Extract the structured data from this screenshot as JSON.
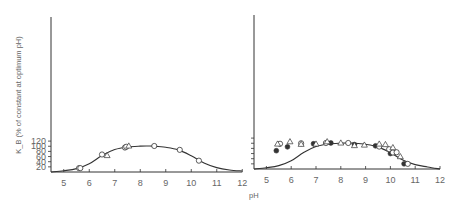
{
  "figure": {
    "ylabel": "K_B (% of constant at optimum pH)",
    "xlabel": "pH",
    "colors": {
      "line": "#333333",
      "marker": "#333333",
      "text": "#666666"
    }
  },
  "chart_data": [
    {
      "type": "scatter",
      "panel": "left",
      "title": "",
      "xlabel": "",
      "ylabel": "K_B (% of constant at optimum pH)",
      "xlim": [
        4.5,
        12
      ],
      "ylim": [
        0,
        120
      ],
      "xticks": [
        5,
        6,
        7,
        8,
        9,
        10,
        11,
        12
      ],
      "yticks": [
        20,
        40,
        60,
        80,
        100,
        120
      ],
      "grid": false,
      "curve": {
        "name": "fitted bell curve",
        "x": [
          4.5,
          5.0,
          5.5,
          6.0,
          6.5,
          7.0,
          7.5,
          8.0,
          8.3,
          8.5,
          9.0,
          9.5,
          10.0,
          10.5,
          11.0,
          11.5,
          12.0
        ],
        "y": [
          0,
          5,
          13,
          32,
          64,
          87,
          97,
          100.5,
          101,
          100.5,
          96,
          86,
          63,
          35,
          17,
          8,
          4
        ]
      },
      "series": [
        {
          "name": "open circles",
          "marker": "circle-open",
          "points": [
            [
              5.6,
              15
            ],
            [
              5.65,
              15
            ],
            [
              6.5,
              68
            ],
            [
              7.4,
              95
            ],
            [
              7.45,
              98
            ],
            [
              8.55,
              101
            ],
            [
              9.55,
              86
            ],
            [
              10.3,
              44
            ]
          ]
        },
        {
          "name": "open triangles",
          "marker": "triangle-open",
          "points": [
            [
              6.7,
              64
            ],
            [
              7.55,
              101
            ]
          ]
        }
      ]
    },
    {
      "type": "scatter",
      "panel": "right",
      "title": "",
      "xlabel": "pH",
      "ylabel": "",
      "xlim": [
        4.5,
        12
      ],
      "ylim": [
        0,
        120
      ],
      "xticks": [
        5,
        6,
        7,
        8,
        9,
        10,
        11,
        12
      ],
      "yticks": [
        20,
        40,
        60,
        80,
        100,
        120
      ],
      "grid": false,
      "curve": {
        "name": "fitted bell curve",
        "x": [
          4.5,
          5.0,
          5.5,
          6.0,
          6.5,
          7.0,
          7.5,
          8.0,
          8.3,
          8.5,
          9.0,
          9.5,
          10.0,
          10.5,
          11.0,
          11.5,
          12.0
        ],
        "y": [
          0,
          5,
          13,
          32,
          64,
          87,
          97,
          100.5,
          101,
          100.5,
          96,
          86,
          63,
          35,
          17,
          8,
          0
        ]
      },
      "series": [
        {
          "name": "filled circles",
          "marker": "circle-filled",
          "points": [
            [
              5.4,
              71
            ],
            [
              5.85,
              86
            ],
            [
              6.9,
              98
            ],
            [
              7.6,
              101
            ],
            [
              8.55,
              95
            ],
            [
              9.4,
              90
            ],
            [
              10.0,
              60
            ],
            [
              10.55,
              20
            ]
          ]
        },
        {
          "name": "open circles",
          "marker": "circle-open",
          "points": [
            [
              5.55,
              98
            ],
            [
              6.4,
              100
            ],
            [
              7.4,
              101
            ],
            [
              8.3,
              101
            ],
            [
              9.55,
              87
            ],
            [
              9.95,
              77
            ],
            [
              10.1,
              64
            ],
            [
              10.25,
              65
            ],
            [
              10.7,
              20
            ]
          ]
        },
        {
          "name": "open triangles",
          "marker": "triangle-open",
          "points": [
            [
              5.45,
              97
            ],
            [
              5.95,
              106
            ],
            [
              6.4,
              96
            ],
            [
              7.0,
              97
            ],
            [
              7.45,
              106
            ],
            [
              8.0,
              101
            ],
            [
              8.55,
              91
            ],
            [
              8.95,
              93
            ],
            [
              9.55,
              97
            ],
            [
              9.8,
              95
            ],
            [
              10.1,
              83
            ],
            [
              10.4,
              48
            ]
          ]
        }
      ]
    }
  ]
}
